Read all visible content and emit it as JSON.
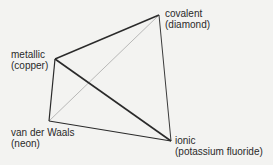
{
  "diagram": {
    "type": "tetrahedron",
    "vertices": [
      {
        "id": "covalent",
        "label": "covalent",
        "example": "(diamond)"
      },
      {
        "id": "metallic",
        "label": "metallic",
        "example": "(copper)"
      },
      {
        "id": "vanderwaals",
        "label": "van der Waals",
        "example": "(neon)"
      },
      {
        "id": "ionic",
        "label": "ionic",
        "example": "(potassium fluoride)"
      }
    ],
    "edges": [
      {
        "from": "metallic",
        "to": "covalent",
        "style": "solid"
      },
      {
        "from": "metallic",
        "to": "vanderwaals",
        "style": "solid"
      },
      {
        "from": "metallic",
        "to": "ionic",
        "style": "solid"
      },
      {
        "from": "covalent",
        "to": "ionic",
        "style": "solid"
      },
      {
        "from": "vanderwaals",
        "to": "ionic",
        "style": "solid"
      },
      {
        "from": "vanderwaals",
        "to": "covalent",
        "style": "light"
      }
    ],
    "colors": {
      "line": "#2a2a2a",
      "hidden_line": "#a8a8a8",
      "background": "#f3f3f1"
    }
  }
}
